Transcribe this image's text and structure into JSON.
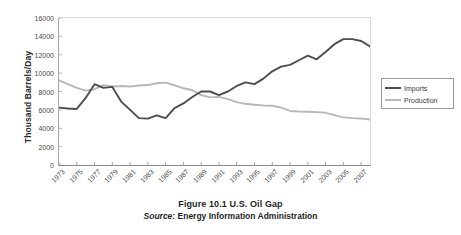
{
  "chart_data": {
    "type": "line",
    "title": "Figure 10.1  U.S. Oil Gap",
    "source": "Source: Energy Information Administration",
    "source_label": "Source:",
    "source_text": " Energy Information Administration",
    "xlabel": "",
    "ylabel": "Thousand Barrels/Day",
    "ylim": [
      0,
      16000
    ],
    "ytick_step": 2000,
    "yticks": [
      0,
      2000,
      4000,
      6000,
      8000,
      10000,
      12000,
      14000,
      16000
    ],
    "ytick_labels": [
      "0",
      "2000",
      "4000",
      "6000",
      "8000",
      "10000",
      "12000",
      "14000",
      "16000"
    ],
    "grid": false,
    "legend_position": "right",
    "x": [
      1973,
      1974,
      1975,
      1976,
      1977,
      1978,
      1979,
      1980,
      1981,
      1982,
      1983,
      1984,
      1985,
      1986,
      1987,
      1988,
      1989,
      1990,
      1991,
      1992,
      1993,
      1994,
      1995,
      1996,
      1997,
      1998,
      1999,
      2000,
      2001,
      2002,
      2003,
      2004,
      2005,
      2006,
      2007,
      2008
    ],
    "xtick_labels": [
      "1973",
      "1975",
      "1977",
      "1979",
      "1981",
      "1983",
      "1985",
      "1987",
      "1989",
      "1991",
      "1993",
      "1995",
      "1997",
      "1999",
      "2001",
      "2003",
      "2005",
      "2007"
    ],
    "xtick_values": [
      1973,
      1975,
      1977,
      1979,
      1981,
      1983,
      1985,
      1987,
      1989,
      1991,
      1993,
      1995,
      1997,
      1999,
      2001,
      2003,
      2005,
      2007
    ],
    "series": [
      {
        "name": "Imports",
        "color": "#4d4d4d",
        "values": [
          6250,
          6150,
          6100,
          7300,
          8800,
          8400,
          8500,
          6900,
          6000,
          5100,
          5050,
          5400,
          5100,
          6200,
          6700,
          7400,
          8000,
          8000,
          7600,
          8000,
          8600,
          9000,
          8800,
          9400,
          10200,
          10700,
          10900,
          11400,
          11900,
          11500,
          12300,
          13150,
          13700,
          13700,
          13500,
          12900
        ],
        "style": "dark-solid"
      },
      {
        "name": "Production",
        "color": "#b8b8b8",
        "values": [
          9200,
          8800,
          8400,
          8100,
          8250,
          8700,
          8550,
          8600,
          8550,
          8650,
          8700,
          8900,
          8970,
          8680,
          8350,
          8140,
          7610,
          7360,
          7420,
          7170,
          6850,
          6660,
          6560,
          6470,
          6450,
          6250,
          5880,
          5820,
          5800,
          5750,
          5680,
          5420,
          5180,
          5100,
          5060,
          4950
        ],
        "style": "light-solid"
      }
    ]
  },
  "legend": {
    "items": [
      {
        "label": "Imports",
        "color": "#4d4d4d"
      },
      {
        "label": "Production",
        "color": "#b8b8b8"
      }
    ]
  }
}
